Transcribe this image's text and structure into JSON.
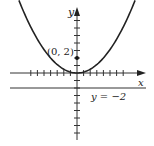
{
  "chart_data": {
    "type": "line",
    "title": "",
    "xlabel": "x",
    "ylabel": "y",
    "curve": {
      "name": "parabola",
      "equation": "y = x^2 / 8",
      "color": "#222222"
    },
    "focus": {
      "label": "(0, 2)",
      "x": 0,
      "y": 2
    },
    "directrix": {
      "label": "y = −2",
      "y": -2
    },
    "x_ticks": [
      -7,
      -6,
      -5,
      -4,
      -3,
      -2,
      -1,
      1,
      2,
      3,
      4,
      5,
      6,
      7
    ],
    "y_ticks": [
      -9,
      -8,
      -7,
      -6,
      -5,
      -4,
      -3,
      -2,
      -1,
      1,
      2,
      3,
      4,
      5,
      6,
      7,
      8
    ],
    "xlim": [
      -10,
      10
    ],
    "ylim": [
      -9,
      9
    ],
    "grid": false,
    "legend": "none"
  },
  "labels": {
    "x_axis": "x",
    "y_axis": "y",
    "focus": "(0, 2)",
    "directrix": "y = −2"
  }
}
